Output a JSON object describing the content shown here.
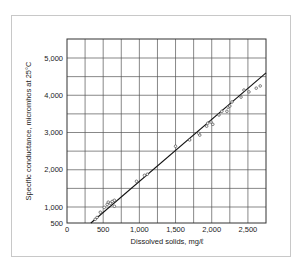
{
  "chart_data": {
    "type": "scatter",
    "title": "",
    "xlabel": "Dissolved solids, mg/ℓ",
    "ylabel": "Specific conductance, micromhos at 25°C",
    "xlim": [
      0,
      2750
    ],
    "ylim": [
      540,
      5500
    ],
    "grid": true,
    "x_ticks": [
      {
        "value": 0,
        "label": "0"
      },
      {
        "value": 500,
        "label": "500"
      },
      {
        "value": 1000,
        "label": "1,000"
      },
      {
        "value": 1500,
        "label": "1,500"
      },
      {
        "value": 2000,
        "label": "2,000"
      },
      {
        "value": 2500,
        "label": "2,500"
      }
    ],
    "y_ticks": [
      {
        "value": 540,
        "label": "500"
      },
      {
        "value": 1000,
        "label": "1,000"
      },
      {
        "value": 2000,
        "label": "2,000"
      },
      {
        "value": 3000,
        "label": "3,000"
      },
      {
        "value": 4000,
        "label": "4,000"
      },
      {
        "value": 5000,
        "label": "5,000"
      }
    ],
    "series": [
      {
        "name": "Observed samples",
        "marker": "open-circle",
        "points": [
          [
            390,
            670
          ],
          [
            415,
            720
          ],
          [
            460,
            860
          ],
          [
            515,
            990
          ],
          [
            555,
            1070
          ],
          [
            570,
            1130
          ],
          [
            600,
            1100
          ],
          [
            625,
            1150
          ],
          [
            655,
            1020
          ],
          [
            655,
            1180
          ],
          [
            960,
            1690
          ],
          [
            1070,
            1850
          ],
          [
            1110,
            1880
          ],
          [
            1500,
            2630
          ],
          [
            1695,
            2800
          ],
          [
            1820,
            2980
          ],
          [
            1835,
            2930
          ],
          [
            1930,
            3170
          ],
          [
            1945,
            3250
          ],
          [
            1990,
            3280
          ],
          [
            2015,
            3220
          ],
          [
            2100,
            3470
          ],
          [
            2140,
            3570
          ],
          [
            2210,
            3570
          ],
          [
            2225,
            3680
          ],
          [
            2250,
            3710
          ],
          [
            2280,
            3820
          ],
          [
            2405,
            3950
          ],
          [
            2445,
            4140
          ],
          [
            2515,
            4090
          ],
          [
            2615,
            4190
          ],
          [
            2670,
            4250
          ]
        ]
      },
      {
        "name": "Fitted line",
        "type": "line",
        "points": [
          [
            330,
            540
          ],
          [
            2750,
            4600
          ]
        ]
      }
    ]
  }
}
